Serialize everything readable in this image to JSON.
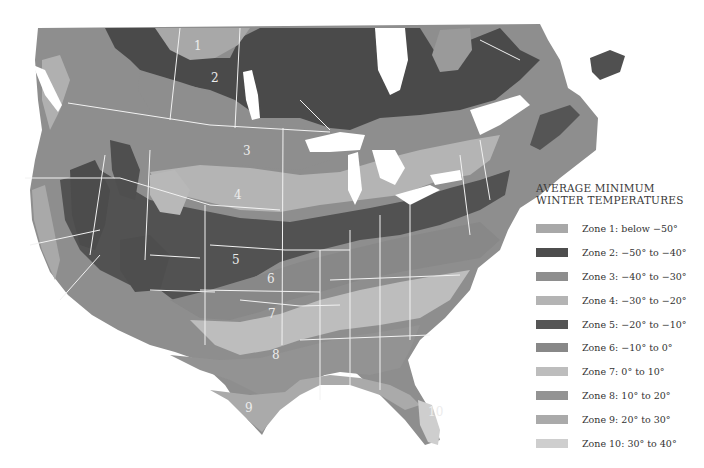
{
  "map": {
    "title_line1": "AVERAGE MINIMUM",
    "title_line2": "WINTER TEMPERATURES",
    "zone_labels": [
      {
        "text": "1",
        "x": 197,
        "y": 48
      },
      {
        "text": "2",
        "x": 215,
        "y": 80
      },
      {
        "text": "3",
        "x": 248,
        "y": 153
      },
      {
        "text": "4",
        "x": 238,
        "y": 197
      },
      {
        "text": "5",
        "x": 235,
        "y": 262
      },
      {
        "text": "6",
        "x": 270,
        "y": 281
      },
      {
        "text": "7",
        "x": 272,
        "y": 316
      },
      {
        "text": "8",
        "x": 276,
        "y": 357
      },
      {
        "text": "9",
        "x": 248,
        "y": 410
      },
      {
        "text": "10",
        "x": 432,
        "y": 415
      }
    ]
  },
  "legend": {
    "items": [
      {
        "zone": 1,
        "label": "Zone 1: below −50°",
        "color": "#a8a8a8"
      },
      {
        "zone": 2,
        "label": "Zone 2: −50° to −40°",
        "color": "#4d4d4d"
      },
      {
        "zone": 3,
        "label": "Zone 3: −40° to −30°",
        "color": "#8e8e8e"
      },
      {
        "zone": 4,
        "label": "Zone 4: −30° to −20°",
        "color": "#b4b4b4"
      },
      {
        "zone": 5,
        "label": "Zone 5: −20° to −10°",
        "color": "#555555"
      },
      {
        "zone": 6,
        "label": "Zone 6: −10° to 0°",
        "color": "#888888"
      },
      {
        "zone": 7,
        "label": "Zone 7: 0° to 10°",
        "color": "#bdbdbd"
      },
      {
        "zone": 8,
        "label": "Zone 8: 10° to 20°",
        "color": "#939393"
      },
      {
        "zone": 9,
        "label": "Zone 9: 20° to 30°",
        "color": "#aaaaaa"
      },
      {
        "zone": 10,
        "label": "Zone 10: 30° to 40°",
        "color": "#cecece"
      }
    ]
  }
}
